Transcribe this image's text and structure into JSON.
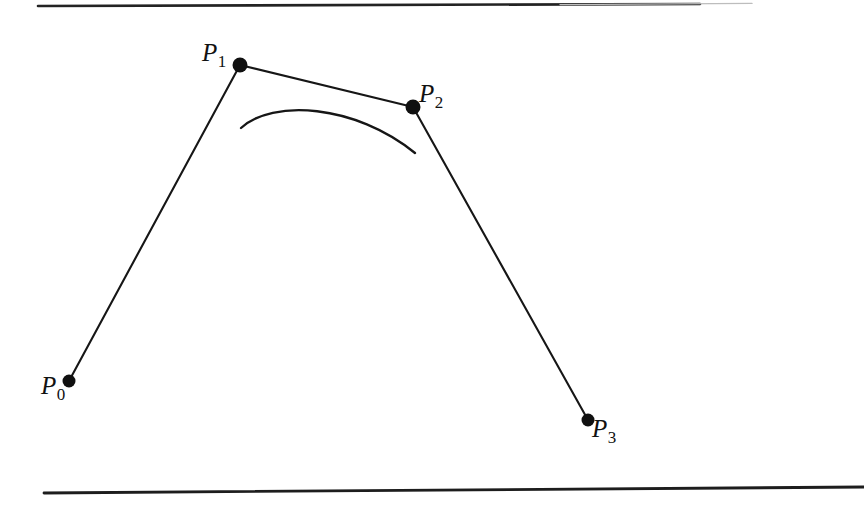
{
  "figure": {
    "type": "diagram",
    "background_color": "#ffffff",
    "ink_color": "#111111",
    "canvas": {
      "width": 864,
      "height": 506
    },
    "rules": {
      "top": {
        "x1": 38,
        "y1": 6,
        "x2": 700,
        "y2": 4,
        "thickness": 2.6
      },
      "bottom": {
        "x1": 44,
        "y1": 493,
        "x2": 864,
        "y2": 487,
        "thickness": 2.8
      }
    },
    "control_points": [
      {
        "id": "P0",
        "label_base": "P",
        "label_sub": "0",
        "x": 69,
        "y": 381,
        "dot_radius": 6.5
      },
      {
        "id": "P1",
        "label_base": "P",
        "label_sub": "1",
        "x": 240,
        "y": 65,
        "dot_radius": 7.5
      },
      {
        "id": "P2",
        "label_base": "P",
        "label_sub": "2",
        "x": 413,
        "y": 107,
        "dot_radius": 7.5
      },
      {
        "id": "P3",
        "label_base": "P",
        "label_sub": "3",
        "x": 588,
        "y": 420,
        "dot_radius": 6.5
      }
    ],
    "control_polygon": {
      "name": "control-polygon",
      "points": "69,381 240,65 413,107 588,420",
      "stroke_width": 2.1
    },
    "bezier_curve": {
      "name": "bezier-curve-arc",
      "start": {
        "x": 241,
        "y": 128
      },
      "control_1": {
        "x": 272,
        "y": 99
      },
      "control_2": {
        "x": 355,
        "y": 104
      },
      "end": {
        "x": 415,
        "y": 153
      },
      "apex": {
        "x": 322,
        "y": 99
      },
      "stroke_width": 2.3
    }
  }
}
